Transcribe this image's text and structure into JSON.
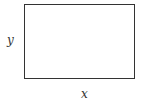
{
  "diagram": {
    "shape": "rectangle",
    "labels": {
      "vertical_side": "y",
      "horizontal_side": "x"
    },
    "colors": {
      "stroke": "#333333",
      "background": "#ffffff"
    }
  }
}
